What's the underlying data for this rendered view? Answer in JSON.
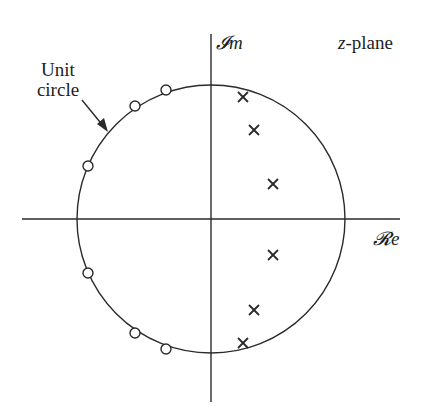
{
  "diagram": {
    "title": "z-plane",
    "title_var": "z",
    "title_suffix": "-plane",
    "axes": {
      "imag_label": "𝓘m",
      "real_label": "𝓡e"
    },
    "annotation": {
      "line1": "Unit",
      "line2": "circle"
    },
    "colors": {
      "stroke": "#2a2a2a",
      "background": "#ffffff"
    },
    "geometry": {
      "center": [
        211,
        219
      ],
      "radius": 134,
      "real_axis": {
        "x1": 22,
        "x2": 400,
        "y": 219
      },
      "imag_axis": {
        "x": 211,
        "y1": 34,
        "y2": 402
      }
    },
    "zeros": [
      {
        "x": 166,
        "y": 90
      },
      {
        "x": 135,
        "y": 106
      },
      {
        "x": 88,
        "y": 166
      },
      {
        "x": 88,
        "y": 273
      },
      {
        "x": 135,
        "y": 333
      },
      {
        "x": 166,
        "y": 349
      }
    ],
    "poles": [
      {
        "x": 243,
        "y": 97
      },
      {
        "x": 254,
        "y": 130
      },
      {
        "x": 273,
        "y": 184
      },
      {
        "x": 273,
        "y": 255
      },
      {
        "x": 254,
        "y": 310
      },
      {
        "x": 243,
        "y": 343
      }
    ]
  }
}
